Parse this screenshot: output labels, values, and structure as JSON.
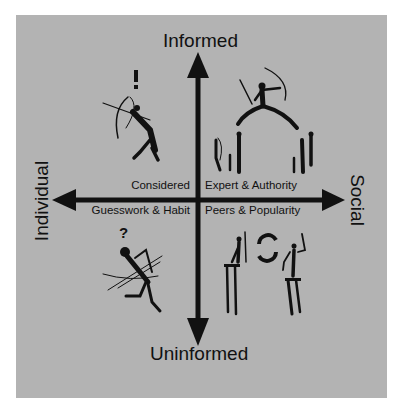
{
  "diagram": {
    "axes": {
      "top": "Informed",
      "bottom": "Uninformed",
      "left": "Individual",
      "right": "Social"
    },
    "quadrants": {
      "top_left": {
        "label": "Considered",
        "icon": "exclamation-mark",
        "figure": "lone-archer"
      },
      "top_right": {
        "label": "Expert & Authority",
        "figure": "leaping-leader-with-onlookers"
      },
      "bottom_left": {
        "label": "Guesswork & Habit",
        "icon": "question-mark",
        "figure": "tangled-archer"
      },
      "bottom_right": {
        "label": "Peers & Popularity",
        "icon": "circular-arrows",
        "figure": "two-figures-copying"
      }
    },
    "colors": {
      "panel": "#b3b3b3",
      "ink": "#111111",
      "page": "#ffffff"
    }
  }
}
